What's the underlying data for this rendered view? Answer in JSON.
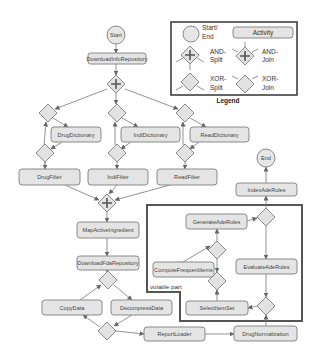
{
  "diagram": {
    "type": "workflow",
    "events": {
      "start": "Start",
      "end": "End"
    },
    "activities": {
      "download_info": "DownloadInfoRepository",
      "drug_dictionary": "DrugDictionary",
      "indi_dictionary": "IndiDictionary",
      "read_dictionary": "ReadDictionary",
      "drug_filter": "DrugFilter",
      "indi_filter": "IndiFilter",
      "read_filter": "ReadFilter",
      "map_active": "MapActiveIngredient",
      "download_fda": "DownloadFdaRepository",
      "copy_data": "CopyData",
      "decompress_data": "DecompressData",
      "report_loader": "ReportLoader",
      "drug_normalization": "DrugNormalization",
      "select_itemset": "SelectItemSet",
      "compute_frequent": "ComputeFrequentItems",
      "generate_ade": "GenerateAdeRules",
      "evaluate_ade": "EvaluateAdeRules",
      "index_ade": "IndexAdeRules"
    },
    "region_label": "volatile part",
    "legend": {
      "title": "Legend",
      "start_end": "Start/",
      "start_end_2": "End",
      "activity": "Activity",
      "and_split_1": "AND-",
      "and_split_2": "Split",
      "and_join_1": "AND-",
      "and_join_2": "Join",
      "xor_split_1": "XOR-",
      "xor_split_2": "Split",
      "xor_join_1": "XOR-",
      "xor_join_2": "Join"
    },
    "colors": {
      "node_fill": "#e4e4e4",
      "node_stroke": "#8a8a8a",
      "region_stroke": "#555555"
    }
  }
}
